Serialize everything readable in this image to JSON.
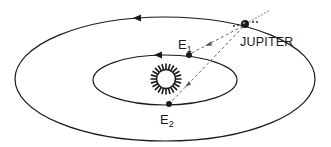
{
  "diagram": {
    "labels": {
      "jupiter": "JUPITER",
      "e1_main": "E",
      "e1_sub": "1",
      "e2_main": "E",
      "e2_sub": "2"
    },
    "bodies": [
      {
        "name": "Sun",
        "x": 166,
        "y": 79,
        "r": 9
      },
      {
        "name": "Jupiter",
        "x": 245,
        "y": 25,
        "r": 4
      },
      {
        "name": "E1",
        "x": 188,
        "y": 55,
        "r": 3
      },
      {
        "name": "E2",
        "x": 169,
        "y": 104,
        "r": 3
      }
    ],
    "orbits": [
      {
        "name": "outer-orbit-jupiter",
        "cx": 165,
        "cy": 79,
        "rx": 150,
        "ry": 62
      },
      {
        "name": "inner-orbit-earth",
        "cx": 165,
        "cy": 80,
        "rx": 72,
        "ry": 25
      }
    ],
    "direction": "counterclockwise (arrows pointing left on top of orbits)",
    "colors": {
      "stroke": "#1a1a1a",
      "background": "#ffffff",
      "dashed": "#555555"
    }
  }
}
